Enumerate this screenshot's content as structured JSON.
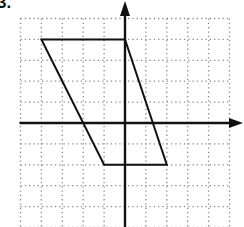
{
  "problem": {
    "label": "3."
  },
  "diagram": {
    "type": "coordinate-grid-with-polygon",
    "grid": {
      "x_min": -5,
      "x_max": 5,
      "y_min": -5,
      "y_max": 5,
      "step": 1,
      "style": "dotted",
      "color": "#8a8a8a"
    },
    "axes": {
      "color": "#111111",
      "x_arrow": "right",
      "y_arrow": "up"
    },
    "shape": {
      "name": "parallelogram",
      "color": "#111111",
      "vertices": [
        [
          -4,
          4
        ],
        [
          0,
          4
        ],
        [
          2,
          -2
        ],
        [
          -1,
          -2
        ]
      ]
    },
    "pixel_mapping": {
      "origin_x": 125,
      "origin_y": 123,
      "unit": 20.9
    }
  }
}
